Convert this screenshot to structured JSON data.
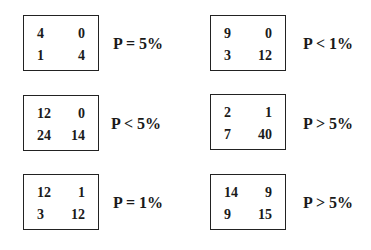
{
  "tables": [
    {
      "cells": [
        "4",
        "0",
        "1",
        "4"
      ],
      "p": "P = 5%"
    },
    {
      "cells": [
        "9",
        "0",
        "3",
        "12"
      ],
      "p": "P < 1%"
    },
    {
      "cells": [
        "12",
        "0",
        "24",
        "14"
      ],
      "p": "P < 5%"
    },
    {
      "cells": [
        "2",
        "1",
        "7",
        "40"
      ],
      "p": "P > 5%"
    },
    {
      "cells": [
        "12",
        "1",
        "3",
        "12"
      ],
      "p": "P = 1%"
    },
    {
      "cells": [
        "14",
        "9",
        "9",
        "15"
      ],
      "p": "P > 5%"
    }
  ]
}
